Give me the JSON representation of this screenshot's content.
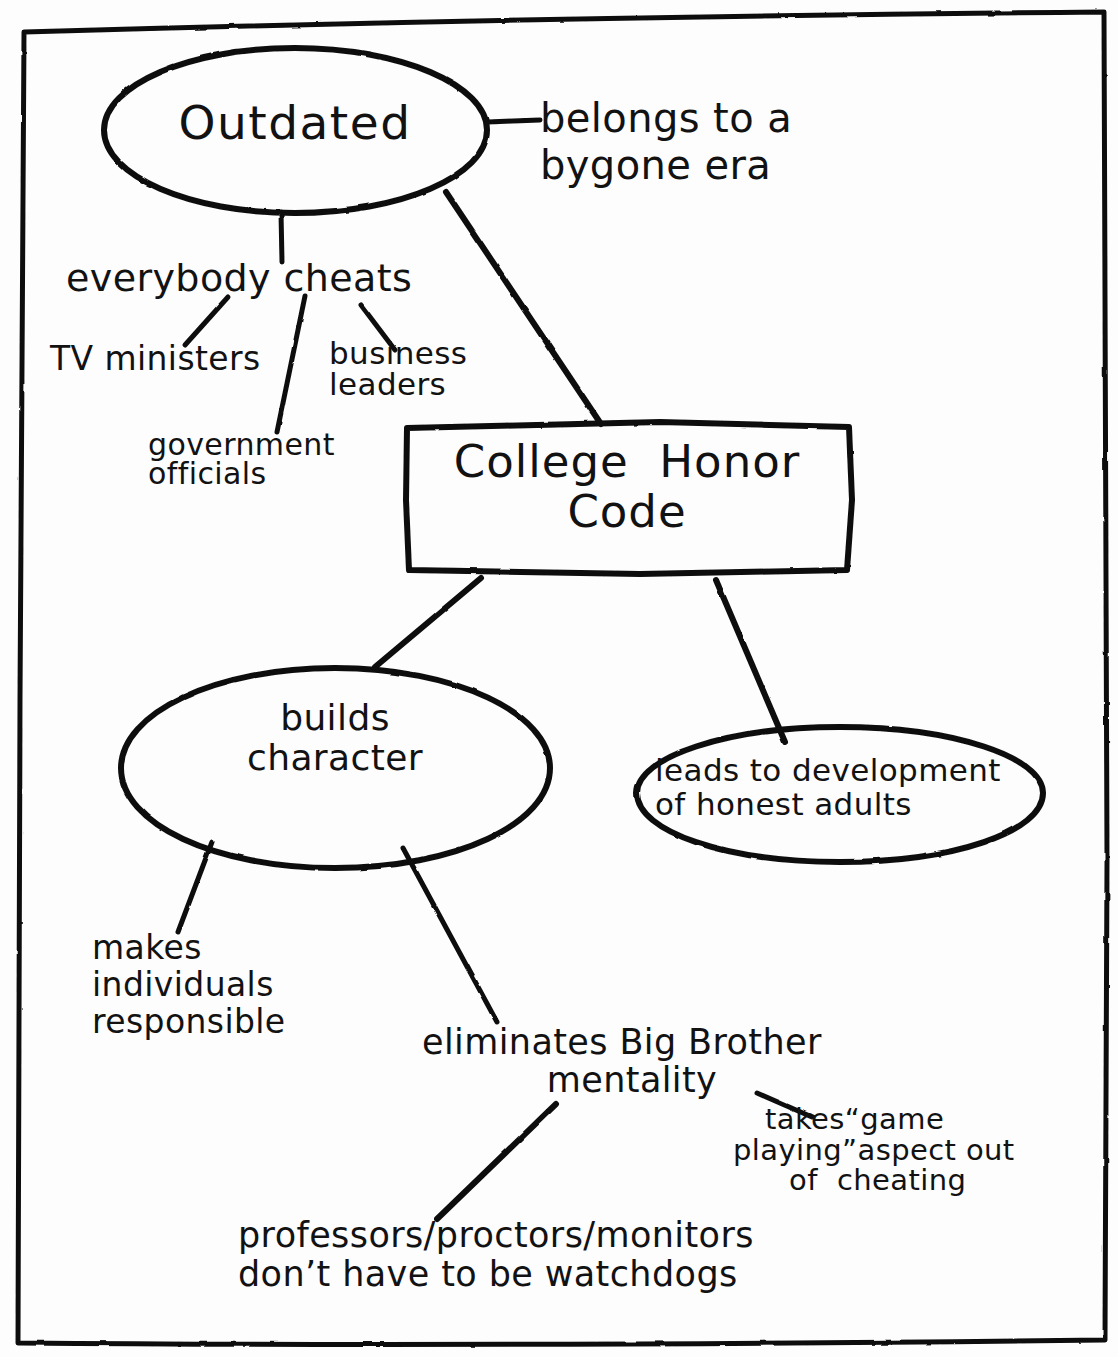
{
  "diagram": {
    "title_node": "College Honor Code",
    "style": {
      "ink_color": "#111111",
      "paper_color": "#fdfdfd",
      "stroke_width": 4
    },
    "border": {
      "name": "hand-drawn-page-border"
    },
    "nodes": [
      {
        "id": "outdated",
        "shape": "ellipse",
        "label": "Outdated",
        "cx": 295,
        "cy": 130,
        "rx": 190,
        "ry": 82
      },
      {
        "id": "honor_code",
        "shape": "rectangle",
        "label_line1": "College  Honor",
        "label_line2": "Code",
        "label": "College Honor Code",
        "x": 405,
        "y": 423,
        "w": 444,
        "h": 148
      },
      {
        "id": "builds_character",
        "shape": "ellipse",
        "label_line1": "builds",
        "label_line2": "character",
        "label": "builds character",
        "cx": 335,
        "cy": 768,
        "rx": 215,
        "ry": 98
      },
      {
        "id": "honest_adults",
        "shape": "ellipse",
        "label_line1": "leads to development",
        "label_line2": "of honest adults",
        "label": "leads to development of honest adults",
        "cx": 840,
        "cy": 793,
        "rx": 205,
        "ry": 68
      }
    ],
    "free_labels": [
      {
        "id": "bygone",
        "text_line1": "belongs to a",
        "text_line2": "bygone era",
        "text": "belongs to a bygone era"
      },
      {
        "id": "everybody",
        "text": "everybody cheats"
      },
      {
        "id": "tv",
        "text": "TV ministers"
      },
      {
        "id": "business",
        "text_line1": "business",
        "text_line2": "leaders",
        "text": "business leaders"
      },
      {
        "id": "government",
        "text_line1": "government",
        "text_line2": "officials",
        "text": "government officials"
      },
      {
        "id": "makes",
        "text_line1": "makes",
        "text_line2": "individuals",
        "text_line3": "responsible",
        "text": "makes individuals responsible"
      },
      {
        "id": "eliminates",
        "text_line1": "eliminates Big Brother",
        "text_line2": "mentality",
        "text": "eliminates Big Brother mentality"
      },
      {
        "id": "takes",
        "text_line1": "takes“game",
        "text_line2": "playing”aspect out",
        "text_line3": "of  cheating",
        "text": "takes “game playing” aspect out of cheating"
      },
      {
        "id": "professors",
        "text_line1": "professors/proctors/monitors",
        "text_line2": "don’t have to be watchdogs",
        "text": "professors/proctors/monitors don’t have to be watchdogs"
      }
    ],
    "connectors": [
      {
        "from": "outdated",
        "to": "bygone",
        "name": "connector-outdated-bygone"
      },
      {
        "from": "outdated",
        "to": "everybody",
        "name": "connector-outdated-everybody-cheats"
      },
      {
        "from": "outdated",
        "to": "honor_code",
        "name": "connector-outdated-honor-code"
      },
      {
        "from": "everybody",
        "to": "tv",
        "name": "connector-everybody-tv-ministers"
      },
      {
        "from": "everybody",
        "to": "government",
        "name": "connector-everybody-government-officials"
      },
      {
        "from": "everybody",
        "to": "business",
        "name": "connector-everybody-business-leaders"
      },
      {
        "from": "honor_code",
        "to": "builds_character",
        "name": "connector-honor-code-builds-character"
      },
      {
        "from": "honor_code",
        "to": "honest_adults",
        "name": "connector-honor-code-honest-adults"
      },
      {
        "from": "builds_character",
        "to": "makes",
        "name": "connector-builds-character-makes-individuals"
      },
      {
        "from": "builds_character",
        "to": "eliminates",
        "name": "connector-builds-character-eliminates-big-brother"
      },
      {
        "from": "eliminates",
        "to": "takes",
        "name": "connector-eliminates-takes-game-playing"
      },
      {
        "from": "eliminates",
        "to": "professors",
        "name": "connector-eliminates-professors-proctors"
      }
    ]
  }
}
